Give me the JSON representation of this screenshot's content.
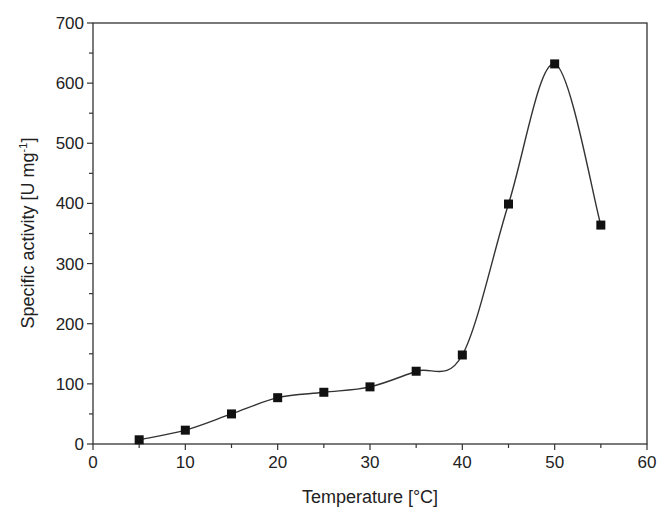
{
  "chart_data": {
    "type": "line",
    "title": "",
    "xlabel": "Temperature [°C]",
    "ylabel": "Specific activity [U mg⁻¹]",
    "ylabel_parts": {
      "main": "Specific activity [U mg",
      "sup": "-1",
      "end": "]"
    },
    "xlim": [
      0,
      60
    ],
    "ylim": [
      0,
      700
    ],
    "xticks": [
      0,
      10,
      20,
      30,
      40,
      50,
      60
    ],
    "yticks": [
      0,
      100,
      200,
      300,
      400,
      500,
      600,
      700
    ],
    "grid": false,
    "legend": null,
    "marker": "square",
    "smooth_line": true,
    "series": [
      {
        "name": "Specific activity",
        "x": [
          5,
          10,
          15,
          20,
          25,
          30,
          35,
          40,
          45,
          50,
          55
        ],
        "values": [
          7,
          23,
          50,
          77,
          86,
          95,
          121,
          148,
          399,
          632,
          364
        ]
      }
    ]
  },
  "colors": {
    "line": "#333333",
    "marker": "#111111",
    "axis": "#333333"
  }
}
